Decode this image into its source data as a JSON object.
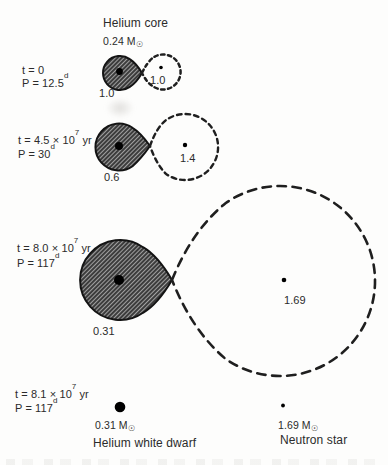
{
  "figure": {
    "header": {
      "label": "Helium core",
      "mass": "0.24 M",
      "sun": "☉"
    },
    "stages": [
      {
        "time_base": "t = 0",
        "time_sup": "",
        "time_tail": "",
        "period_base": "P = 12.5",
        "period_sup": "d",
        "donor_mass": "1.0",
        "accretor_mass": "1.0"
      },
      {
        "time_base": "t = 4.5 × 10",
        "time_sup": "7",
        "time_tail": " yr",
        "period_base": "P = 30",
        "period_sup": "d",
        "donor_mass": "0.6",
        "accretor_mass": "1.4"
      },
      {
        "time_base": "t = 8.0 × 10",
        "time_sup": "7",
        "time_tail": " yr",
        "period_base": "P = 117",
        "period_sup": "d",
        "donor_mass": "0.31",
        "accretor_mass": "1.69"
      },
      {
        "time_base": "t = 8.1 × 10",
        "time_sup": "7",
        "time_tail": " yr",
        "period_base": "P = 117",
        "period_sup": "d",
        "donor_mass": "0.31 M",
        "donor_sun": "☉",
        "accretor_mass": "1.69 M",
        "accretor_sun": "☉",
        "donor_name": "Helium white dwarf",
        "accretor_name": "Neutron star"
      }
    ],
    "colors": {
      "ink": "#2b2b2b",
      "outline": "#141414",
      "dash": "#1f1f1f",
      "hatch_line": "#1a1a1a",
      "hatch_gap": "#a0a0a0",
      "paper": "#fdfdfc"
    }
  }
}
